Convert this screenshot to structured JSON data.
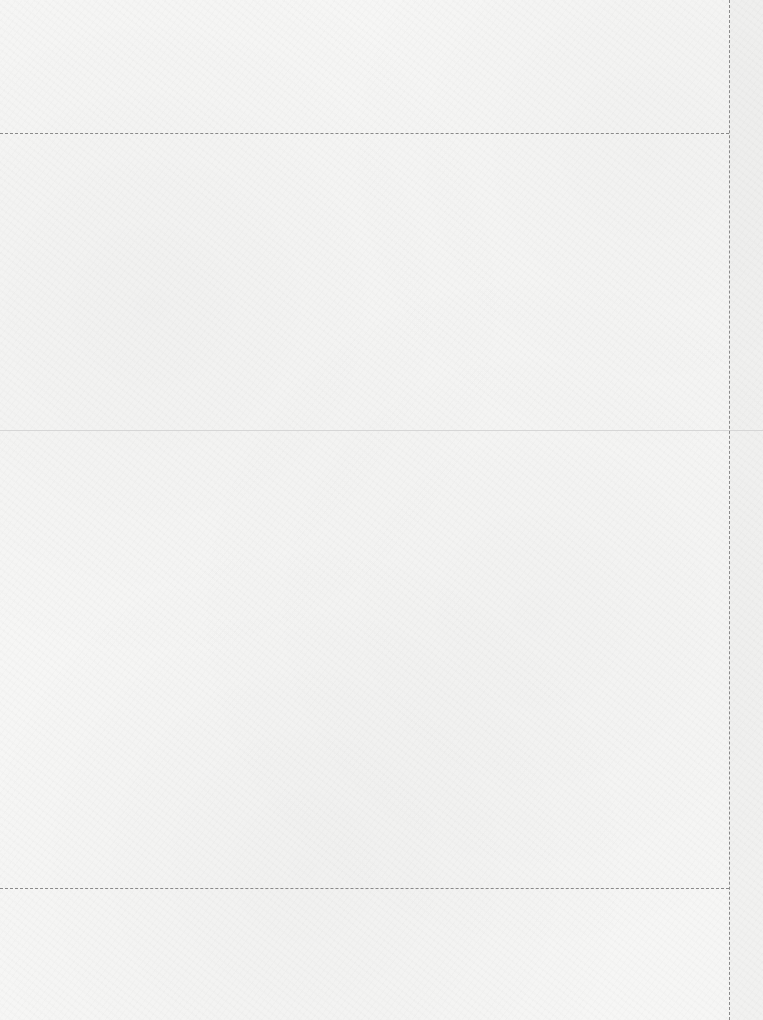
{
  "page": {
    "background_color": "#f6f6f5",
    "guide_color": "#8a8a8a",
    "divider_color": "#d6d6d6"
  },
  "guides": {
    "top_dashed_y": 133,
    "middle_solid_y": 430,
    "bottom_dashed_y": 888,
    "right_dashed_x": 729
  }
}
